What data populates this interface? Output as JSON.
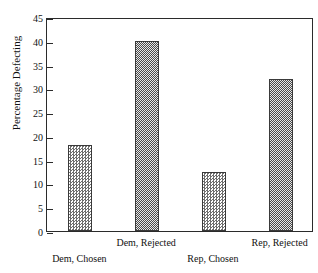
{
  "chart_data": {
    "type": "bar",
    "title": "National Election Studies",
    "xlabel": "",
    "ylabel": "Percentage Defecting",
    "categories": [
      "Dem, Chosen",
      "Dem, Rejected",
      "Rep, Chosen",
      "Rep, Rejected"
    ],
    "values": [
      18,
      40,
      12.5,
      32
    ],
    "ylim": [
      0,
      45
    ],
    "ytick_values": [
      0,
      5,
      10,
      15,
      20,
      25,
      30,
      35,
      40,
      45
    ],
    "ytick_labels": [
      "0",
      "5",
      "10",
      "15",
      "20",
      "25",
      "30",
      "35",
      "40",
      "45"
    ],
    "grid": false,
    "legend": null,
    "legend_position": "none",
    "bar_fill": "gray checkerboard dither",
    "bar_outline_color": "#3a3a3a",
    "axis_color": "#2b2b2b",
    "background_color": "#ffffff",
    "label_stagger": [
      "bottom",
      "top",
      "bottom",
      "top"
    ]
  },
  "axes": {
    "y_title": "Percentage Defecting"
  },
  "title": {
    "text": "National Election Studies"
  }
}
